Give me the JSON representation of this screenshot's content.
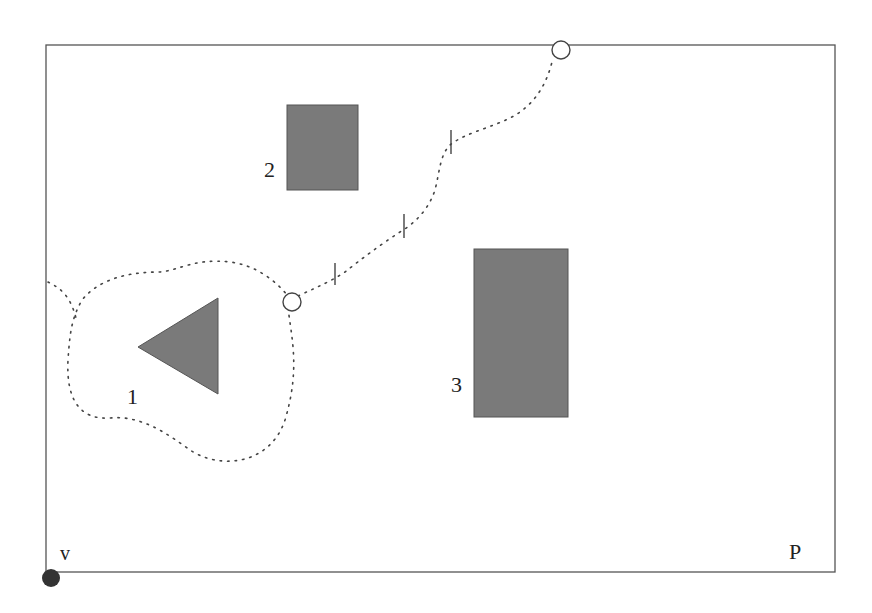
{
  "diagram": {
    "colors": {
      "obstacle": "#7a7a7a",
      "border": "#555555",
      "path": "#444444",
      "text": "#222222"
    },
    "boundary": {
      "x": 46,
      "y": 45,
      "width": 789,
      "height": 527
    },
    "labels": {
      "obstacle_1": "1",
      "obstacle_2": "2",
      "obstacle_3": "3",
      "start_point": "v",
      "region": "P"
    },
    "obstacles": [
      {
        "id": "1",
        "shape": "triangle",
        "points": "138,347 218,298 218,394"
      },
      {
        "id": "2",
        "shape": "rectangle",
        "x": 287,
        "y": 105,
        "width": 71,
        "height": 85
      },
      {
        "id": "3",
        "shape": "rectangle",
        "x": 474,
        "y": 249,
        "width": 94,
        "height": 168
      }
    ],
    "waypoints": [
      {
        "name": "circle-mid",
        "cx": 292,
        "cy": 302,
        "r": 9
      },
      {
        "name": "circle-top",
        "cx": 561,
        "cy": 50,
        "r": 9
      }
    ],
    "start_dot": {
      "cx": 51,
      "cy": 578,
      "r": 9
    }
  }
}
